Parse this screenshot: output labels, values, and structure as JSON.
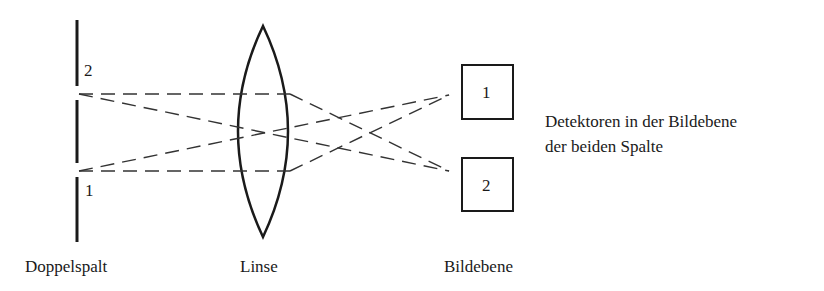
{
  "labels": {
    "double_slit": "Doppelspalt",
    "lens": "Linse",
    "image_plane": "Bildebene",
    "detector_caption_line1": "Detektoren in der Bildebene",
    "detector_caption_line2": "der beiden Spalte"
  },
  "slits": [
    {
      "id": "2",
      "label": "2"
    },
    {
      "id": "1",
      "label": "1"
    }
  ],
  "detectors": [
    {
      "id": "1",
      "label": "1"
    },
    {
      "id": "2",
      "label": "2"
    }
  ],
  "colors": {
    "stroke": "#1a1a1a",
    "ray": "#333333",
    "background": "#ffffff"
  }
}
